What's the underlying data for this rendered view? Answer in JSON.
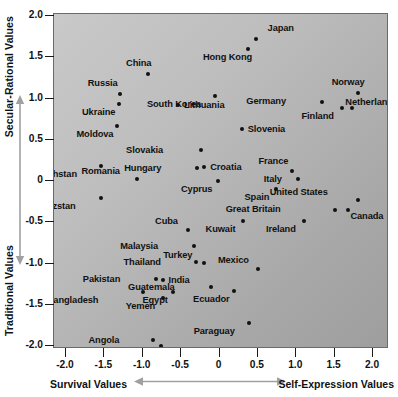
{
  "chart_data": {
    "type": "scatter",
    "title": "",
    "xlabel_left": "Survival Values",
    "xlabel_right": "Self-Expression Values",
    "ylabel_top": "Secular-Rational Values",
    "ylabel_bottom": "Traditional Values",
    "xlim": [
      -2.3,
      2.3
    ],
    "ylim": [
      -2.2,
      2.0
    ],
    "xticks": [
      "-2.0",
      "-1.5",
      "-1.0",
      "-0.5",
      "0",
      "0.5",
      "1.0",
      "1.5",
      "2.0"
    ],
    "xtick_values": [
      -2.0,
      -1.5,
      -1.0,
      -0.5,
      0,
      0.5,
      1.0,
      1.5,
      2.0
    ],
    "yticks": [
      "2.0",
      "1.5",
      "1.0",
      "0.5",
      "0",
      "-0.5",
      "-1.0",
      "-1.5",
      "-2.0"
    ],
    "ytick_values": [
      2.0,
      1.5,
      1.0,
      0.5,
      0,
      -0.5,
      -1.0,
      -1.5,
      -2.0
    ],
    "grid": false,
    "legend": "none",
    "points": [
      {
        "label": "Japan",
        "x": 0.47,
        "y": 1.72,
        "lx": 12,
        "ly": -15
      },
      {
        "label": "Hong Kong",
        "x": 0.37,
        "y": 1.6,
        "lx": -4,
        "ly": 4
      },
      {
        "label": "China",
        "x": -0.93,
        "y": 1.3,
        "lx": -5,
        "ly": -15
      },
      {
        "label": "Norway",
        "x": 1.8,
        "y": 1.07,
        "lx": -1,
        "ly": -15
      },
      {
        "label": "Russia",
        "x": -1.3,
        "y": 1.05,
        "lx": -10,
        "ly": -15
      },
      {
        "label": "South Korea",
        "x": -0.06,
        "y": 1.03,
        "lx": -22,
        "ly": 4
      },
      {
        "label": "Germany",
        "x": 1.34,
        "y": 0.96,
        "lx": -44,
        "ly": -5
      },
      {
        "label": "Ukraine",
        "x": -1.31,
        "y": 0.93,
        "lx": -12,
        "ly": 4
      },
      {
        "label": "Netherlands",
        "x": 1.6,
        "y": 0.88,
        "lx": 3,
        "ly": -10
      },
      {
        "label": "Finland",
        "x": 1.72,
        "y": 0.88,
        "lx": -26,
        "ly": 4
      },
      {
        "label": "Lithuania",
        "x": -0.54,
        "y": 0.92,
        "lx": 6,
        "ly": -4
      },
      {
        "label": "Moldova",
        "x": -1.33,
        "y": 0.67,
        "lx": -12,
        "ly": 4
      },
      {
        "label": "Slovenia",
        "x": 0.29,
        "y": 0.63,
        "lx": 6,
        "ly": -4
      },
      {
        "label": "Slovakia",
        "x": -0.24,
        "y": 0.38,
        "lx": -46,
        "ly": -4
      },
      {
        "label": "Croatia",
        "x": -0.2,
        "y": 0.17,
        "lx": 6,
        "ly": -4
      },
      {
        "label": "Hungary",
        "x": -0.29,
        "y": 0.16,
        "lx": -44,
        "ly": -4
      },
      {
        "label": "Romania",
        "x": -1.07,
        "y": 0.03,
        "lx": -25,
        "ly": -12
      },
      {
        "label": "France",
        "x": 0.95,
        "y": 0.12,
        "lx": -12,
        "ly": -14
      },
      {
        "label": "Italy",
        "x": 1.02,
        "y": 0.02,
        "lx": -24,
        "ly": -4
      },
      {
        "label": "Kazakhstan",
        "x": -1.54,
        "y": 0.18,
        "lx": -32,
        "ly": 4
      },
      {
        "label": "Cyprus",
        "x": -0.02,
        "y": 0.0,
        "lx": -14,
        "ly": 4
      },
      {
        "label": "Spain",
        "x": 0.73,
        "y": -0.1,
        "lx": -14,
        "ly": 4
      },
      {
        "label": "United States",
        "x": 1.8,
        "y": -0.23,
        "lx": -38,
        "ly": -12
      },
      {
        "label": "Canada",
        "x": 1.68,
        "y": -0.35,
        "lx": 2,
        "ly": 2
      },
      {
        "label": "Great Britain",
        "x": 1.5,
        "y": -0.35,
        "lx": -62,
        "ly": -5
      },
      {
        "label": "Kyrgyzstan",
        "x": -1.55,
        "y": -0.21,
        "lx": -33,
        "ly": 4
      },
      {
        "label": "Kuwait",
        "x": 0.3,
        "y": -0.48,
        "lx": -15,
        "ly": 4
      },
      {
        "label": "Ireland",
        "x": 1.1,
        "y": -0.49,
        "lx": -16,
        "ly": 4
      },
      {
        "label": "Cuba",
        "x": -0.41,
        "y": -0.59,
        "lx": -18,
        "ly": -13
      },
      {
        "label": "Malaysia",
        "x": -0.33,
        "y": -0.79,
        "lx": -44,
        "ly": -4
      },
      {
        "label": "Turkey",
        "x": -0.2,
        "y": -0.99,
        "lx": -20,
        "ly": -12
      },
      {
        "label": "Thailand",
        "x": -0.3,
        "y": -0.98,
        "lx": -44,
        "ly": -4
      },
      {
        "label": "Mexico",
        "x": 0.5,
        "y": -1.07,
        "lx": -17,
        "ly": -13
      },
      {
        "label": "Pakistan",
        "x": -0.83,
        "y": -1.19,
        "lx": -44,
        "ly": -4
      },
      {
        "label": "India",
        "x": -0.73,
        "y": -1.2,
        "lx": 5,
        "ly": -4
      },
      {
        "label": "Guatemala",
        "x": -0.11,
        "y": -1.29,
        "lx": -44,
        "ly": -4
      },
      {
        "label": "Ecuador",
        "x": 0.19,
        "y": -1.33,
        "lx": -12,
        "ly": 4
      },
      {
        "label": "Egypt",
        "x": -0.6,
        "y": -1.35,
        "lx": -14,
        "ly": 4
      },
      {
        "label": "Bangladesh",
        "x": -1.0,
        "y": -1.34,
        "lx": -52,
        "ly": 4
      },
      {
        "label": "Yemen",
        "x": -0.74,
        "y": -1.42,
        "lx": -16,
        "ly": 4
      },
      {
        "label": "Paraguay",
        "x": 0.38,
        "y": -1.72,
        "lx": -22,
        "ly": 4
      },
      {
        "label": "Angola",
        "x": -0.86,
        "y": -1.93,
        "lx": -42,
        "ly": -4
      },
      {
        "label": "Ethiopia",
        "x": -0.76,
        "y": -2.0,
        "lx": -16,
        "ly": 4
      }
    ]
  },
  "axes": {
    "y_title_top": "Secular-Rational Values",
    "y_title_bottom": "Traditional Values",
    "x_title_left": "Survival Values",
    "x_title_right": "Self-Expression Values"
  }
}
